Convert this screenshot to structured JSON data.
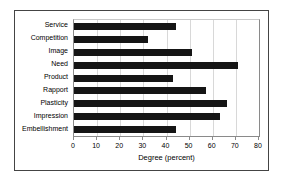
{
  "chart_data": {
    "type": "bar",
    "orientation": "horizontal",
    "title": "",
    "xlabel": "Degree (percent)",
    "ylabel": "",
    "xlim": [
      0,
      80
    ],
    "xticks": [
      0,
      10,
      20,
      30,
      40,
      50,
      60,
      70,
      80
    ],
    "grid": true,
    "legend": false,
    "categories": [
      "Service",
      "Competition",
      "Image",
      "Need",
      "Product",
      "Rapport",
      "Plasticity",
      "Impression",
      "Embellishment"
    ],
    "values": [
      44,
      32,
      51,
      71,
      43,
      57,
      66,
      63,
      44
    ],
    "bar_color": "#151515"
  }
}
